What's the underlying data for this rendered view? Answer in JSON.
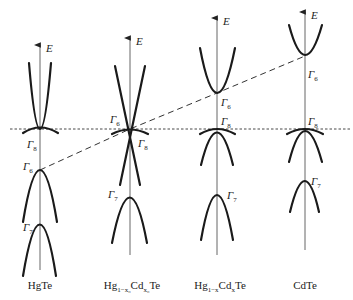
{
  "figure": {
    "type": "band-structure-evolution",
    "axis_label": "E",
    "fermi_line_style": "dotted",
    "trend_line_style": "dashed",
    "columns": [
      {
        "name": "HgTe",
        "name_parts": {
          "base": "HgTe"
        },
        "axis_x": 40,
        "labels": [
          {
            "text": "Γ",
            "sub": "8"
          },
          {
            "text": "Γ",
            "sub": "6"
          },
          {
            "text": "Γ",
            "sub": "7"
          }
        ]
      },
      {
        "name": "Hg1-x0Cdx0Te",
        "name_parts": {
          "a": "Hg",
          "a_sub": "1−x₀",
          "b": "Cd",
          "b_sub": "x₀",
          "c": "Te"
        },
        "axis_x": 130,
        "labels": [
          {
            "text": "Γ",
            "sub": "6"
          },
          {
            "text": "Γ",
            "sub": "8"
          },
          {
            "text": "Γ",
            "sub": "7"
          }
        ]
      },
      {
        "name": "Hg1-xCdxTe",
        "name_parts": {
          "a": "Hg",
          "a_sub": "1−x",
          "b": "Cd",
          "b_sub": "x",
          "c": "Te"
        },
        "axis_x": 217,
        "labels": [
          {
            "text": "Γ",
            "sub": "6"
          },
          {
            "text": "Γ",
            "sub": "8"
          },
          {
            "text": "Γ",
            "sub": "7"
          }
        ]
      },
      {
        "name": "CdTe",
        "name_parts": {
          "base": "CdTe"
        },
        "axis_x": 305,
        "labels": [
          {
            "text": "Γ",
            "sub": "6"
          },
          {
            "text": "Γ",
            "sub": "8"
          },
          {
            "text": "Γ",
            "sub": "7"
          }
        ]
      }
    ]
  }
}
